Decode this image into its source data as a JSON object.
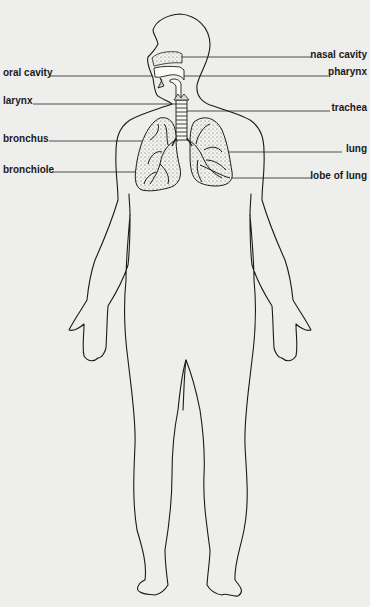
{
  "diagram": {
    "title": "",
    "colors": {
      "background": "#eeeeec",
      "outline": "#1a1a1a",
      "leader_line": "#3a3a3a",
      "stipple": "#6a6a6a"
    },
    "labels_left": [
      {
        "id": "oral-cavity",
        "text": "oral cavity",
        "y": 73
      },
      {
        "id": "larynx",
        "text": "larynx",
        "y": 101
      },
      {
        "id": "bronchus",
        "text": "bronchus",
        "y": 139
      },
      {
        "id": "bronchiole",
        "text": "bronchiole",
        "y": 170
      }
    ],
    "labels_right": [
      {
        "id": "nasal-cavity",
        "text": "nasal cavity",
        "y": 55
      },
      {
        "id": "pharynx",
        "text": "pharynx",
        "y": 72
      },
      {
        "id": "trachea",
        "text": "trachea",
        "y": 108
      },
      {
        "id": "lung",
        "text": "lung",
        "y": 149
      },
      {
        "id": "lobe-of-lung",
        "text": "lobe of lung",
        "y": 176
      }
    ]
  }
}
